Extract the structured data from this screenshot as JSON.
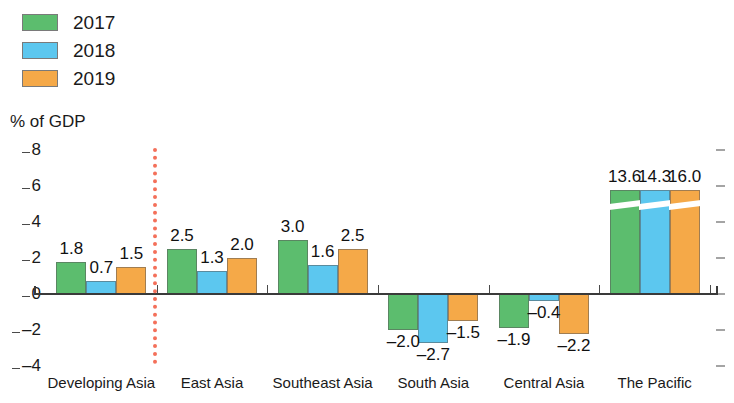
{
  "chart_data": {
    "type": "bar",
    "title": "",
    "subtitle": "",
    "xlabel": "",
    "ylabel": "% of GDP",
    "ylim": [
      -4,
      8
    ],
    "yticks": [
      8,
      6,
      4,
      2,
      0,
      -2,
      -4
    ],
    "ytick_labels": [
      "8",
      "6",
      "4",
      "2",
      "0",
      "–2",
      "–4"
    ],
    "grid": false,
    "legend_position": "top-left",
    "categories": [
      "Developing Asia",
      "East Asia",
      "Southeast Asia",
      "South Asia",
      "Central Asia",
      "The Pacific"
    ],
    "series": [
      {
        "name": "2017",
        "color": "#5cbd6e",
        "values": [
          1.8,
          2.5,
          3.0,
          -2.0,
          -1.9,
          13.6
        ],
        "labels": [
          "1.8",
          "2.5",
          "3.0",
          "–2.0",
          "–1.9",
          "13.6"
        ]
      },
      {
        "name": "2018",
        "color": "#5cc7ef",
        "values": [
          0.7,
          1.3,
          1.6,
          -2.7,
          -0.4,
          14.3
        ],
        "labels": [
          "0.7",
          "1.3",
          "1.6",
          "–2.7",
          "–0.4",
          "14.3"
        ]
      },
      {
        "name": "2019",
        "color": "#f5a948",
        "values": [
          1.5,
          2.0,
          2.5,
          -1.5,
          -2.2,
          16.0
        ],
        "labels": [
          "1.5",
          "2.0",
          "2.5",
          "–1.5",
          "–2.2",
          "16.0"
        ]
      }
    ],
    "annotations": [
      {
        "name": "aggregate-separator",
        "kind": "vertical-dotted-line",
        "color": "#f4705a",
        "after_category": "Developing Asia"
      },
      {
        "name": "axis-break",
        "kind": "truncated-bars",
        "applies_to_category": "The Pacific",
        "note": "Bars exceed axis maximum and are drawn with a white break slash"
      }
    ]
  },
  "legend": {
    "items": [
      {
        "label": "2017",
        "color": "#5cbd6e"
      },
      {
        "label": "2018",
        "color": "#5cc7ef"
      },
      {
        "label": "2019",
        "color": "#f5a948"
      }
    ]
  },
  "colors": {
    "series_2017": "#5cbd6e",
    "series_2018": "#5cc7ef",
    "series_2019": "#f5a948",
    "separator": "#f4705a",
    "axis": "#3a3a3a",
    "text": "#1a1a1a",
    "background": "#ffffff"
  }
}
